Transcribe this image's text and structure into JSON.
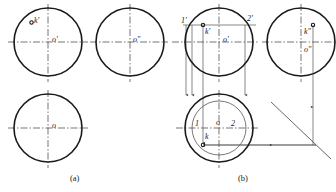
{
  "figure": {
    "panels": [
      {
        "id": "a",
        "caption": "(a)",
        "caption_x": 70,
        "caption_y": 173,
        "views": [
          {
            "name": "front-view",
            "center_label": "o'",
            "cx": 48,
            "cy": 42,
            "r": 34
          },
          {
            "name": "side-view",
            "center_label": "o\"",
            "cx": 130,
            "cy": 42,
            "r": 34
          },
          {
            "name": "top-view",
            "center_label": "o",
            "cx": 48,
            "cy": 128,
            "r": 34
          }
        ],
        "points": [
          {
            "name": "k-prime-point",
            "label": "k'",
            "x": 33,
            "y": 22
          }
        ]
      },
      {
        "id": "b",
        "caption": "(b)",
        "caption_x": 238,
        "caption_y": 173,
        "views": [
          {
            "name": "front-view",
            "center_label": "o'",
            "cx": 219,
            "cy": 42,
            "r": 34
          },
          {
            "name": "side-view",
            "center_label": "o\"",
            "cx": 301,
            "cy": 42,
            "r": 34
          },
          {
            "name": "top-view",
            "center_label": "o",
            "cx": 219,
            "cy": 128,
            "r": 34
          }
        ],
        "points": [
          {
            "name": "point-1-prime",
            "label": "1'",
            "x": 182,
            "y": 21
          },
          {
            "name": "point-2-prime",
            "label": "2'",
            "x": 248,
            "y": 19
          },
          {
            "name": "point-k-prime",
            "label": "k'",
            "x": 206,
            "y": 29
          },
          {
            "name": "point-k-dprime",
            "label": "k\"",
            "x": 305,
            "y": 29
          },
          {
            "name": "point-1",
            "label": "1",
            "x": 195,
            "y": 122
          },
          {
            "name": "point-2",
            "label": "2",
            "x": 230,
            "y": 122
          },
          {
            "name": "point-k",
            "label": "k",
            "x": 205,
            "y": 136
          }
        ],
        "auxiliary_circle": {
          "name": "auxiliary-latitude-circle",
          "cx": 219,
          "cy": 128,
          "r": 27
        }
      }
    ],
    "colors": {
      "outline": "#1a1a1a",
      "centerline": "#3a3a3a",
      "construction": "#555555",
      "text": "#1a1a1a"
    },
    "linework": {
      "outline_width": 1.6,
      "centerline_width": 0.7,
      "construction_width": 0.7,
      "centerline_dash": "7 2 1.5 2"
    }
  }
}
